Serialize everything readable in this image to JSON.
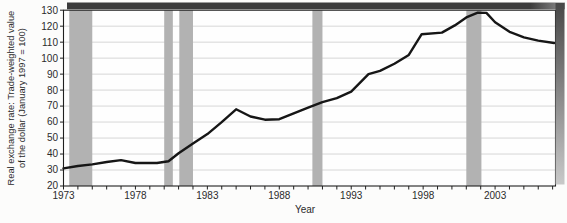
{
  "page": {
    "background": "#fcfcfb"
  },
  "chart_data": {
    "type": "line",
    "title": "",
    "xlabel": "Year",
    "ylabel_lines": [
      "Real exchange rate: Trade-weighted value",
      "of the dollar (January 1997 = 100)"
    ],
    "xlim": [
      1973,
      2007.2
    ],
    "ylim": [
      20,
      130
    ],
    "y_ticks": [
      20,
      30,
      40,
      50,
      60,
      70,
      80,
      90,
      100,
      110,
      120,
      130
    ],
    "x_label_years": [
      1973,
      1978,
      1983,
      1988,
      1993,
      1998,
      2003
    ],
    "x_minor_tick_step": 1,
    "grid": "horizontal",
    "legend_position": "none",
    "colors": {
      "line": "#161616",
      "grid": "#d2d2d2",
      "recession_band": "#b2b2b2",
      "frame": "#1f1f1f",
      "tick_text": "#2b2b2b",
      "plot_background": "#fefefe",
      "shadow_dark": "#3c3c3c",
      "shadow_light": "#c9c9c9"
    },
    "recession_bands": [
      [
        1973.4,
        1975.0
      ],
      [
        1980.0,
        1980.6
      ],
      [
        1981.05,
        1982.0
      ],
      [
        1990.3,
        1991.0
      ],
      [
        2001.0,
        2002.05
      ]
    ],
    "series": [
      {
        "name": "real-trade-weighted-dollar-index",
        "x": [
          1973,
          1974,
          1975,
          1976,
          1977,
          1978,
          1979.5,
          1980.3,
          1981,
          1982,
          1983,
          1984,
          1985,
          1986,
          1987,
          1988,
          1989,
          1990,
          1991,
          1992,
          1993,
          1994.2,
          1995,
          1996,
          1997,
          1997.9,
          1999.3,
          2000.2,
          2001,
          2001.8,
          2002.4,
          2003,
          2004,
          2005,
          2006,
          2007.1
        ],
        "y": [
          31,
          32.5,
          33.5,
          35,
          36.2,
          34.4,
          34.4,
          35.5,
          40.5,
          46.5,
          52.5,
          60,
          68,
          63.5,
          61.5,
          61.8,
          65.5,
          69,
          72.5,
          75,
          79,
          90,
          92,
          96.5,
          102,
          115,
          116,
          120.5,
          125.5,
          128.5,
          128.3,
          122.5,
          116.5,
          113,
          111,
          109.5
        ]
      }
    ]
  }
}
